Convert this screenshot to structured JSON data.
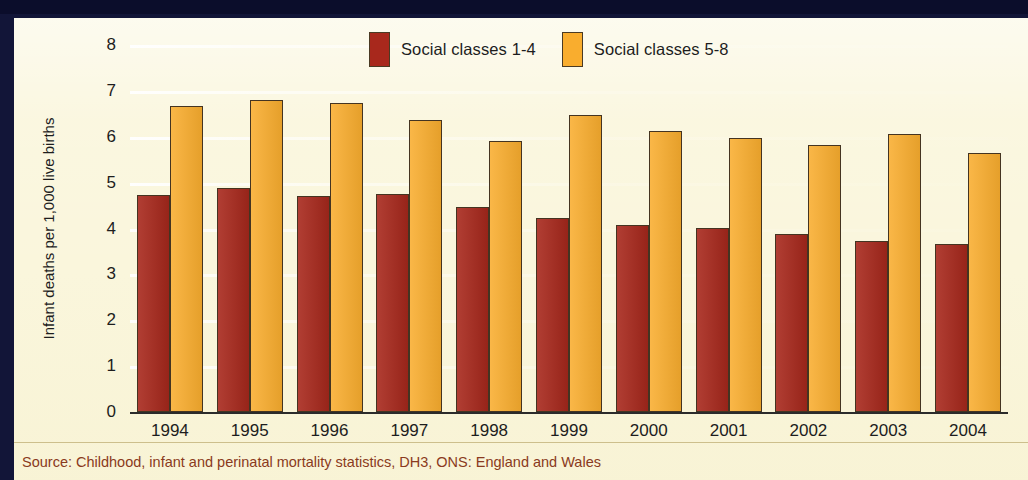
{
  "chart_data": {
    "type": "bar",
    "title": "",
    "xlabel": "",
    "ylabel": "Infant deaths per 1,000 live births",
    "ylim": [
      0,
      8
    ],
    "ytick_labels": [
      "8",
      "7",
      "6",
      "5",
      "4",
      "3",
      "2",
      "1",
      "0"
    ],
    "ytick_values": [
      8,
      7,
      6,
      5,
      4,
      3,
      2,
      1,
      0
    ],
    "grid": true,
    "legend_position": "top-center",
    "categories": [
      "1994",
      "1995",
      "1996",
      "1997",
      "1998",
      "1999",
      "2000",
      "2001",
      "2002",
      "2003",
      "2004"
    ],
    "series": [
      {
        "name": "Social classes 1-4",
        "color": "#a8281c",
        "values": [
          4.72,
          4.88,
          4.7,
          4.75,
          4.47,
          4.23,
          4.07,
          4.02,
          3.88,
          3.73,
          3.66
        ]
      },
      {
        "name": "Social classes 5-8",
        "color": "#f9ad2e",
        "values": [
          6.67,
          6.8,
          6.73,
          6.36,
          5.91,
          6.48,
          6.12,
          5.97,
          5.81,
          6.07,
          5.64
        ]
      }
    ],
    "source": "Source: Childhood, infant and perinatal mortality statistics, DH3, ONS: England and Wales"
  },
  "legend": {
    "items": [
      {
        "label": "Social classes 1-4",
        "swatch": "red-swatch"
      },
      {
        "label": "Social classes 5-8",
        "swatch": "orange-swatch"
      }
    ]
  },
  "colors": {
    "series_1": "#a8281c",
    "series_2": "#f9ad2e",
    "panel_background": "#faf6dc",
    "frame": "#0b0d2b",
    "source_text": "#8a3a20"
  }
}
